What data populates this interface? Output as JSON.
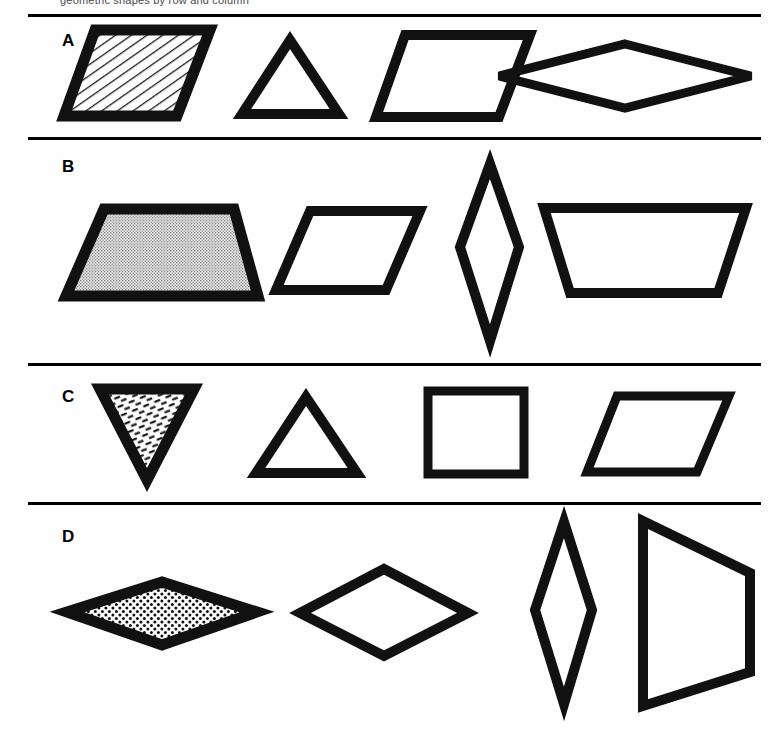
{
  "figure": {
    "clipped_caption_text": "geometric shapes by row and column",
    "background_color": "#ffffff",
    "stroke_color": "#111111",
    "rule_color": "#000000",
    "rows": [
      {
        "label": "A",
        "label_x": 62,
        "label_y": 32,
        "rule_y": 14,
        "shapes": [
          {
            "name": "parallelogram-hatched",
            "description": "right-leaning parallelogram with diagonal line hatching",
            "fill": "hatch",
            "x": 62,
            "y": 28,
            "w": 150,
            "h": 90,
            "points": "33,2 148,2 115,88 2,88",
            "stroke_width": 11
          },
          {
            "name": "triangle-upright",
            "description": "upright isosceles triangle, unfilled",
            "fill": "none",
            "x": 238,
            "y": 36,
            "w": 105,
            "h": 82,
            "points": "52,4 101,78 4,78",
            "stroke_width": 10
          },
          {
            "name": "parallelogram-left-lean",
            "description": "left-leaning parallelogram, unfilled",
            "fill": "none",
            "x": 372,
            "y": 30,
            "w": 162,
            "h": 92,
            "points": "33,5 158,5 127,87 4,87",
            "stroke_width": 10
          },
          {
            "name": "rhombus-wide-flat",
            "description": "wide flat rhombus (horizontal diamond), unfilled",
            "fill": "none",
            "x": 494,
            "y": 40,
            "w": 262,
            "h": 72,
            "points": "131,4 257,36 131,68 5,36",
            "stroke_width": 9
          }
        ]
      },
      {
        "label": "B",
        "label_x": 62,
        "label_y": 158,
        "rule_y": 137,
        "shapes": [
          {
            "name": "trapezoid-stippled",
            "description": "trapezoid with narrow top, filled with fine stipple texture",
            "fill": "stipple",
            "x": 62,
            "y": 205,
            "w": 200,
            "h": 96,
            "points": "42,4 172,4 196,91 4,91",
            "stroke_width": 11
          },
          {
            "name": "parallelogram-right-lean-b",
            "description": "right-leaning parallelogram, unfilled",
            "fill": "none",
            "x": 272,
            "y": 207,
            "w": 153,
            "h": 88,
            "points": "38,4 148,4 114,83 4,83",
            "stroke_width": 10
          },
          {
            "name": "rhombus-tall-narrow-b",
            "description": "tall narrow vertical rhombus, unfilled",
            "fill": "none",
            "x": 455,
            "y": 160,
            "w": 70,
            "h": 185,
            "points": "35,4 64,87 35,181 5,87",
            "stroke_width": 10
          },
          {
            "name": "trapezoid-inverted",
            "description": "trapezoid with wide top and narrow bottom, unfilled",
            "fill": "none",
            "x": 540,
            "y": 204,
            "w": 212,
            "h": 94,
            "points": "4,4 206,4 178,89 30,89",
            "stroke_width": 10
          }
        ]
      },
      {
        "label": "C",
        "label_x": 62,
        "label_y": 388,
        "rule_y": 363,
        "shapes": [
          {
            "name": "triangle-inverted-dashed-fill",
            "description": "downward-pointing triangle filled with short dash texture",
            "fill": "dashes",
            "x": 95,
            "y": 385,
            "w": 104,
            "h": 100,
            "points": "5,4 99,4 52,95",
            "stroke_width": 11
          },
          {
            "name": "triangle-upright-c",
            "description": "upright triangle, unfilled",
            "fill": "none",
            "x": 252,
            "y": 393,
            "w": 110,
            "h": 85,
            "points": "54,4 105,80 4,80",
            "stroke_width": 10
          },
          {
            "name": "square-c",
            "description": "square, unfilled",
            "fill": "none",
            "x": 423,
            "y": 387,
            "w": 106,
            "h": 92,
            "points": "5,4 101,4 101,87 5,87",
            "stroke_width": 9
          },
          {
            "name": "parallelogram-c",
            "description": "right-leaning parallelogram, unfilled",
            "fill": "none",
            "x": 583,
            "y": 392,
            "w": 150,
            "h": 85,
            "points": "34,4 146,4 114,80 4,80",
            "stroke_width": 9
          }
        ]
      },
      {
        "label": "D",
        "label_x": 62,
        "label_y": 528,
        "rule_y": 502,
        "shapes": [
          {
            "name": "rhombus-wide-dotted",
            "description": "wide flat rhombus filled with regular dot grid",
            "fill": "dots",
            "x": 62,
            "y": 578,
            "w": 200,
            "h": 72,
            "points": "100,4 195,34 100,67 5,34",
            "stroke_width": 11
          },
          {
            "name": "rhombus-d2",
            "description": "diamond / rhombus, unfilled",
            "fill": "none",
            "x": 295,
            "y": 565,
            "w": 178,
            "h": 96,
            "points": "89,4 173,48 89,91 5,48",
            "stroke_width": 10
          },
          {
            "name": "rhombus-tall-narrow-d",
            "description": "tall narrow vertical rhombus, unfilled",
            "fill": "none",
            "x": 530,
            "y": 518,
            "w": 68,
            "h": 190,
            "points": "34,4 62,92 34,186 5,92",
            "stroke_width": 10
          },
          {
            "name": "trapezoid-vertical-d",
            "description": "trapezoid rotated, vertical left edge with slanted right edge",
            "fill": "none",
            "x": 638,
            "y": 517,
            "w": 118,
            "h": 193,
            "points": "5,4 112,56 112,155 5,189",
            "stroke_width": 10
          }
        ]
      }
    ]
  }
}
